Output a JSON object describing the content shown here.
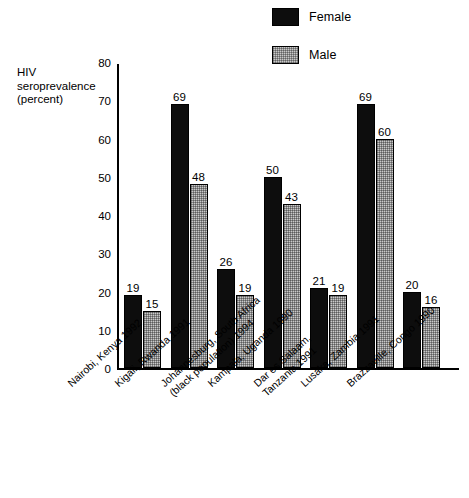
{
  "chart_data": {
    "type": "bar",
    "title": "",
    "xlabel": "",
    "ylabel": "HIV seroprevalence (percent)",
    "ylabel_lines": [
      "HIV",
      "seroprevalence",
      "(percent)"
    ],
    "ylim": [
      0,
      80
    ],
    "yticks": [
      0,
      10,
      20,
      30,
      40,
      50,
      60,
      70,
      80
    ],
    "ytick_labels": [
      "0",
      "10",
      "20",
      "30",
      "40",
      "50",
      "60",
      "70",
      "80"
    ],
    "grid": false,
    "legend_position": "top-right",
    "categories": [
      "Nairobi, Kenya 1992",
      "Kigali, Rwanda 1991",
      "Johannesburg, South Africa (black population) 1994",
      "Kampala, Uganda 1990",
      "Dar es Salaam, Tanzania 1991",
      "Lusaka, Zambia 1991",
      "Brazzaville, Congo 1990"
    ],
    "category_lines": [
      [
        "Nairobi, Kenya 1992"
      ],
      [
        "Kigali, Rwanda 1991"
      ],
      [
        "Johannesburg, South Africa",
        "(black population) 1994"
      ],
      [
        "Kampala, Uganda 1990"
      ],
      [
        "Dar es Salaam,",
        "Tanzania 1991"
      ],
      [
        "Lusaka, Zambia 1991"
      ],
      [
        "Brazzaville, Congo 1990"
      ]
    ],
    "series": [
      {
        "name": "Female",
        "color": "#0d0d0d",
        "values": [
          19,
          69,
          26,
          50,
          21,
          69,
          20
        ],
        "value_labels": [
          "19",
          "69",
          "26",
          "50",
          "21",
          "69",
          "20"
        ]
      },
      {
        "name": "Male",
        "color": "#c9c9c9",
        "values": [
          15,
          48,
          19,
          43,
          19,
          60,
          16
        ],
        "value_labels": [
          "15",
          "48",
          "19",
          "43",
          "19",
          "60",
          "16"
        ]
      }
    ]
  },
  "legend": {
    "items": [
      {
        "label": "Female",
        "swatch": "female-swatch"
      },
      {
        "label": "Male",
        "swatch": "male-swatch"
      }
    ]
  }
}
